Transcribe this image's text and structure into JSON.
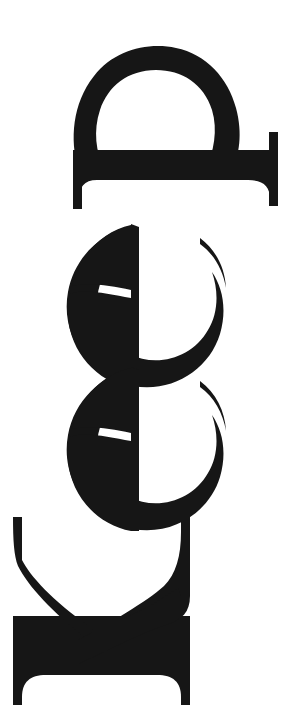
{
  "artwork": {
    "title": "Keep",
    "word": "Keep",
    "reading_direction": "bottom-to-top",
    "rotation_degrees": 90,
    "rotation_sense": "counter-clockwise",
    "typeface_style": "bold high-contrast didone serif",
    "medium": "scanned print",
    "ink_color": "#161616",
    "paper_color": "#ffffff",
    "glyph_order_top_to_bottom": [
      "p",
      "e",
      "e",
      "K"
    ],
    "glyphs": [
      {
        "name": "glyph-p",
        "letter": "p",
        "index": 0,
        "description": "lowercase p rotated 90 degrees counter-clockwise; bowl at top, stem forms the horizontal bar with hairline serifs at both ends"
      },
      {
        "name": "glyph-e-upper",
        "letter": "e",
        "index": 1,
        "description": "lowercase e rotated 90 degrees counter-clockwise; vertical crossbar, aperture terminal opening toward upper right"
      },
      {
        "name": "glyph-e-lower",
        "letter": "e",
        "index": 2,
        "description": "lowercase e rotated 90 degrees counter-clockwise; vertical crossbar, aperture terminal opening toward upper right"
      },
      {
        "name": "glyph-k",
        "letter": "K",
        "index": 3,
        "description": "capital K rotated 90 degrees counter-clockwise; serifed stem forms the lower horizontal bar, arm and leg rise as two diagonal strokes"
      }
    ]
  }
}
